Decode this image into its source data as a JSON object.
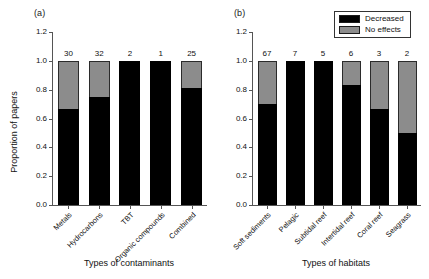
{
  "legend": {
    "position": "top-right",
    "entries": [
      {
        "label": "Decreased",
        "color": "#000000"
      },
      {
        "label": "No effects",
        "color": "#8c8c8c"
      }
    ]
  },
  "panels": [
    {
      "tag": "(a)",
      "ylabel": "Proportion of papers",
      "xlabel": "Types of contaminants",
      "yticks": [
        "0.0",
        "0.2",
        "0.4",
        "0.6",
        "0.8",
        "1.0",
        "1.2"
      ]
    },
    {
      "tag": "(b)",
      "ylabel": "Proportion of papers",
      "xlabel": "Types of habitats",
      "yticks": [
        "0.0",
        "0.2",
        "0.4",
        "0.6",
        "0.8",
        "1.0",
        "1.2"
      ]
    }
  ],
  "chart_data": [
    {
      "type": "bar",
      "subplot": "(a)",
      "stacked": true,
      "normalized": true,
      "title": "",
      "xlabel": "Types of contaminants",
      "ylabel": "Proportion of papers",
      "ylim": [
        0.0,
        1.2
      ],
      "yticks": [
        0.0,
        0.2,
        0.4,
        0.6,
        0.8,
        1.0,
        1.2
      ],
      "grid": false,
      "categories": [
        "Metals",
        "Hydrocarbons",
        "TBT",
        "Organic compounds",
        "Combined"
      ],
      "sample_sizes": [
        30,
        32,
        2,
        1,
        25
      ],
      "series": [
        {
          "name": "Decreased",
          "color": "#000000",
          "values": [
            0.67,
            0.75,
            1.0,
            1.0,
            0.81
          ]
        },
        {
          "name": "No effects",
          "color": "#8c8c8c",
          "values": [
            0.33,
            0.25,
            0.0,
            0.0,
            0.19
          ]
        }
      ],
      "bars": [
        {
          "category": "Metals",
          "n": "30",
          "decreased": 0.67,
          "no_effects": 0.33
        },
        {
          "category": "Hydrocarbons",
          "n": "32",
          "decreased": 0.75,
          "no_effects": 0.25
        },
        {
          "category": "TBT",
          "n": "2",
          "decreased": 1.0,
          "no_effects": 0.0
        },
        {
          "category": "Organic compounds",
          "n": "1",
          "decreased": 1.0,
          "no_effects": 0.0
        },
        {
          "category": "Combined",
          "n": "25",
          "decreased": 0.81,
          "no_effects": 0.19
        }
      ]
    },
    {
      "type": "bar",
      "subplot": "(b)",
      "stacked": true,
      "normalized": true,
      "title": "",
      "xlabel": "Types of habitats",
      "ylabel": "Proportion of papers",
      "ylim": [
        0.0,
        1.2
      ],
      "yticks": [
        0.0,
        0.2,
        0.4,
        0.6,
        0.8,
        1.0,
        1.2
      ],
      "grid": false,
      "categories": [
        "Soft sediments",
        "Pelagic",
        "Subtidal reef",
        "Intertidal reef",
        "Coral reef",
        "Seagrass"
      ],
      "sample_sizes": [
        67,
        7,
        5,
        6,
        3,
        2
      ],
      "series": [
        {
          "name": "Decreased",
          "color": "#000000",
          "values": [
            0.7,
            1.0,
            1.0,
            0.83,
            0.67,
            0.5
          ]
        },
        {
          "name": "No effects",
          "color": "#8c8c8c",
          "values": [
            0.3,
            0.0,
            0.0,
            0.17,
            0.33,
            0.5
          ]
        }
      ],
      "bars": [
        {
          "category": "Soft sediments",
          "n": "67",
          "decreased": 0.7,
          "no_effects": 0.3
        },
        {
          "category": "Pelagic",
          "n": "7",
          "decreased": 1.0,
          "no_effects": 0.0
        },
        {
          "category": "Subtidal reef",
          "n": "5",
          "decreased": 1.0,
          "no_effects": 0.0
        },
        {
          "category": "Intertidal reef",
          "n": "6",
          "decreased": 0.83,
          "no_effects": 0.17
        },
        {
          "category": "Coral reef",
          "n": "3",
          "decreased": 0.67,
          "no_effects": 0.33
        },
        {
          "category": "Seagrass",
          "n": "2",
          "decreased": 0.5,
          "no_effects": 0.5
        }
      ]
    }
  ]
}
